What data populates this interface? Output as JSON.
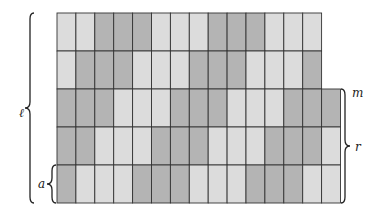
{
  "diagram": {
    "title": "",
    "colors": {
      "L": "#dcdcdc",
      "D": "#b4b4b4",
      "border": "#333333",
      "brace": "#222222"
    },
    "grid": {
      "left": 57,
      "top": 13,
      "col_width": 18.9,
      "row_height": 38,
      "rows": [
        {
          "cells": [
            "L",
            "L",
            "D",
            "D",
            "D",
            "L",
            "L",
            "L",
            "D",
            "D",
            "D",
            "L",
            "L",
            "L"
          ]
        },
        {
          "cells": [
            "L",
            "D",
            "D",
            "D",
            "L",
            "L",
            "L",
            "D",
            "D",
            "D",
            "L",
            "L",
            "L",
            "D"
          ]
        },
        {
          "cells": [
            "D",
            "D",
            "D",
            "L",
            "L",
            "L",
            "D",
            "D",
            "D",
            "L",
            "L",
            "L",
            "D",
            "D",
            "D"
          ]
        },
        {
          "cells": [
            "D",
            "D",
            "L",
            "L",
            "L",
            "D",
            "D",
            "D",
            "L",
            "L",
            "L",
            "D",
            "D",
            "D",
            "L"
          ]
        },
        {
          "cells": [
            "D",
            "L",
            "L",
            "L",
            "D",
            "D",
            "D",
            "L",
            "L",
            "L",
            "D",
            "D",
            "D",
            "L",
            "L"
          ]
        }
      ]
    },
    "labels": {
      "ell": "ℓ",
      "a": "a",
      "m": "m",
      "r": "r"
    },
    "braces": [
      {
        "name": "ell-brace",
        "side": "left",
        "x": 30,
        "y1": 13,
        "y2": 203,
        "label": "ell"
      },
      {
        "name": "a-brace",
        "side": "left",
        "x": 52,
        "y1": 165,
        "y2": 203,
        "label": "a"
      },
      {
        "name": "r-brace",
        "side": "right",
        "x": 345,
        "y1": 89,
        "y2": 203,
        "label": "r"
      }
    ]
  }
}
